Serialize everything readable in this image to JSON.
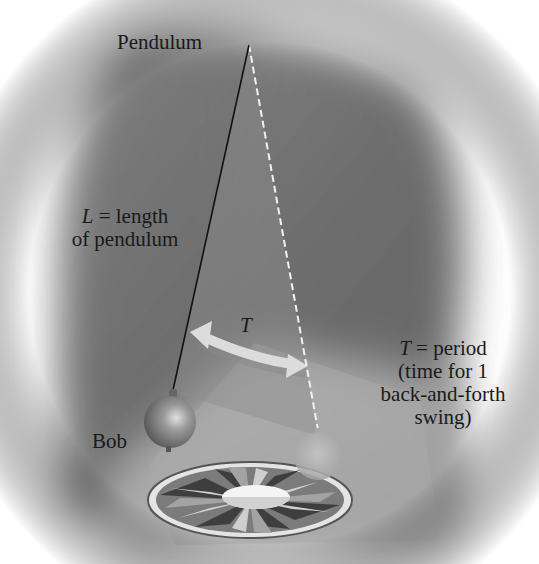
{
  "diagram": {
    "title_label": "Pendulum",
    "length_label": {
      "symbol": "L",
      "line1_rest": " = length",
      "line2": "of pendulum"
    },
    "arrow_label": "T",
    "period_label": {
      "symbol": "T",
      "line1_rest": " = period",
      "line2": "(time for 1",
      "line3": "back-and-forth",
      "line4": "swing)"
    },
    "bob_label": "Bob",
    "colors": {
      "wall": "#7a7a7a",
      "wall_dark": "#5e5e5e",
      "floor": "#a9a9a9",
      "string": "#111111",
      "dashed_string": "#f2f2f2",
      "arrow": "#d8d8d8",
      "bob": "#8a8a8a",
      "ghost_bob": "#b5b5b5",
      "text": "#1a1a1a"
    }
  }
}
